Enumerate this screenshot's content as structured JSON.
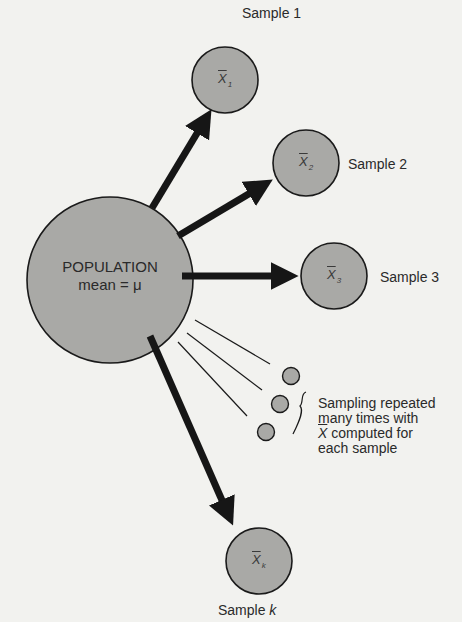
{
  "diagram": {
    "population": {
      "title": "POPULATION",
      "subtitle": "mean = μ"
    },
    "samples": [
      {
        "label": "Sample 1",
        "stat": "X",
        "sub": "1"
      },
      {
        "label": "Sample 2",
        "stat": "X",
        "sub": "2"
      },
      {
        "label": "Sample 3",
        "stat": "X",
        "sub": "3"
      },
      {
        "label": "Sample k",
        "label_main": "Sample ",
        "label_var": "k",
        "stat": "X",
        "sub": "k"
      }
    ],
    "repeated_note": {
      "line1": "Sampling repeated",
      "line2": "many times with",
      "line3_symbol": "X",
      "line3_rest": " computed for",
      "line4": "each sample"
    },
    "colors": {
      "circle_fill": "#a9a9a6",
      "outline": "#1a1a1a",
      "arrow": "#161616",
      "background": "#f2f2ef"
    }
  }
}
